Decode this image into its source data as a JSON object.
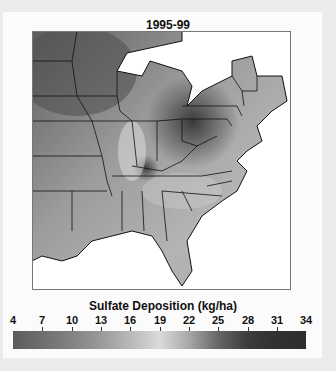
{
  "title": "1995-99",
  "colorbar": {
    "label": "Sulfate Deposition (kg/ha)",
    "ticks": [
      "4",
      "7",
      "10",
      "13",
      "16",
      "19",
      "22",
      "25",
      "28",
      "31",
      "34"
    ],
    "min": 4,
    "max": 34,
    "colors": {
      "low": "#5c5c5c",
      "mid": "#dadada",
      "high": "#2d2d2d"
    }
  },
  "map": {
    "region": "Eastern United States",
    "hotspot": "Ohio Valley / western Pennsylvania",
    "background": "#ffffff"
  }
}
